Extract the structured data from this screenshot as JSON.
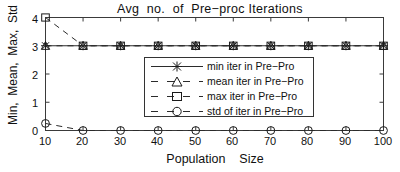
{
  "chart_data": {
    "type": "line",
    "title": "Avg  no.  of  Pre−proc Iterations",
    "xlabel": "Population    Size",
    "ylabel": "Min,  Mean,  Max,  Std",
    "x": [
      10,
      20,
      30,
      40,
      50,
      60,
      70,
      80,
      90,
      100
    ],
    "xticklabels": [
      "10",
      "20",
      "30",
      "40",
      "50",
      "60",
      "70",
      "80",
      "90",
      "100"
    ],
    "yticklabels": [
      "0",
      "1",
      "2",
      "3",
      "4"
    ],
    "yticks": [
      0,
      1,
      2,
      3,
      4
    ],
    "xlim": [
      10,
      100
    ],
    "ylim": [
      0,
      4
    ],
    "grid": false,
    "legend_position": "center",
    "series": [
      {
        "name": "min iter in Pre−Pro",
        "marker": "asterisk-marker",
        "linestyle": "solid",
        "values": [
          3,
          3,
          3,
          3,
          3,
          3,
          3,
          3,
          3,
          3
        ]
      },
      {
        "name": "mean iter in Pre−Pro",
        "marker": "triangle-marker",
        "linestyle": "dashed",
        "values": [
          3,
          3,
          3,
          3,
          3,
          3,
          3,
          3,
          3,
          3
        ]
      },
      {
        "name": "max iter in Pre−Pro",
        "marker": "square-marker",
        "linestyle": "dashed",
        "values": [
          4,
          3,
          3,
          3,
          3,
          3,
          3,
          3,
          3,
          3
        ]
      },
      {
        "name": "std of iter in Pre−Pro",
        "marker": "circle-marker",
        "linestyle": "dashed",
        "values": [
          0.25,
          0,
          0,
          0,
          0,
          0,
          0,
          0,
          0,
          0
        ]
      }
    ],
    "colors": {
      "line": "#2b2b2b",
      "axis": "#333333",
      "text": "#101010",
      "background": "#ffffff"
    }
  }
}
